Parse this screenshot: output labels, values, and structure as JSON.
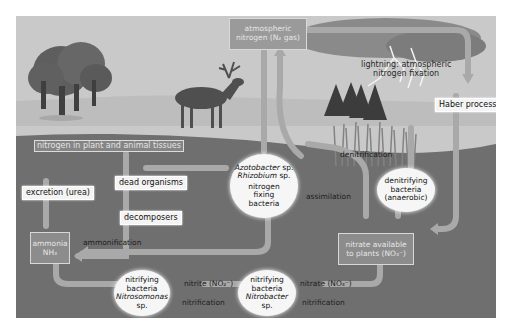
{
  "diagram": {
    "colors": {
      "sky": "#c9c9c9",
      "ground": "#6f6f6f",
      "arrow": "#a9a9a9",
      "box_grey": "#8c8c8c",
      "oval": "#f6f6f6"
    },
    "nodes": {
      "atmospheric": {
        "line1": "atmospheric",
        "line2": "nitrogen (N₂ gas)"
      },
      "lightning": {
        "line1": "lightning: atmospheric",
        "line2": "nitrogen fixation"
      },
      "haber": "Haber process",
      "tissues": "nitrogen in plant and animal tissues",
      "excretion": "excretion (urea)",
      "dead_organisms": "dead organisms",
      "decomposers": "decomposers",
      "ammonia": {
        "line1": "ammonia",
        "line2": "NH₃"
      },
      "fixing_bacteria": {
        "line1": "Azotobacter",
        "line1b": " sp.",
        "line2": "Rhizobium",
        "line2b": " sp.",
        "line3": "nitrogen",
        "line4": "fixing",
        "line5": "bacteria"
      },
      "denitrifying_bacteria": {
        "line1": "denitrifying",
        "line2": "bacteria",
        "line3": "(anaerobic)"
      },
      "nitrate_available": {
        "line1": "nitrate available",
        "line2": "to plants (NO₃⁻)"
      },
      "nitrosomonas": {
        "line1": "nitrifying",
        "line2": "bacteria",
        "line3": "Nitrosomonas",
        "line4": "sp."
      },
      "nitrobacter": {
        "line1": "nitrifying",
        "line2": "bacteria",
        "line3": "Nitrobacter",
        "line4": "sp."
      }
    },
    "flows": {
      "ammonification": "ammonification",
      "denitrification": "denitrification",
      "assimilation": "assimilation",
      "nitrite": "nitrite (NO₂⁻)",
      "nitrate": "nitrate (NO₃⁻)",
      "nitrification_1": "nitrification",
      "nitrification_2": "nitrification"
    }
  }
}
